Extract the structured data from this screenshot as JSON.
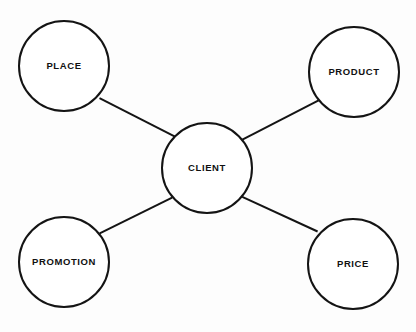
{
  "diagram": {
    "type": "hub-and-spoke",
    "title": "",
    "background_color": "#fdfdfd",
    "stroke_color": "#141414",
    "node_fill_color": "#ffffff",
    "text_color": "#111111",
    "center": {
      "id": "client",
      "label": "CLIENT",
      "cx": 207,
      "cy": 168,
      "r": 45
    },
    "nodes": [
      {
        "id": "place",
        "label": "PLACE",
        "cx": 64,
        "cy": 66,
        "r": 45,
        "position": "top-left"
      },
      {
        "id": "product",
        "label": "PRODUCT",
        "cx": 354,
        "cy": 72,
        "r": 45,
        "position": "top-right"
      },
      {
        "id": "promotion",
        "label": "PROMOTION",
        "cx": 64,
        "cy": 262,
        "r": 45,
        "position": "bottom-left"
      },
      {
        "id": "price",
        "label": "PRICE",
        "cx": 353,
        "cy": 264,
        "r": 45,
        "position": "bottom-right"
      }
    ],
    "edges": [
      {
        "id": "place-client",
        "from": "place",
        "to": "client",
        "x1": 99.5,
        "y1": 98.2,
        "x2": 175.5,
        "y2": 136.8
      },
      {
        "id": "client-product",
        "from": "client",
        "to": "product",
        "x1": 242.4,
        "y1": 139.7,
        "x2": 318.6,
        "y2": 100.3
      },
      {
        "id": "promotion-client",
        "from": "promotion",
        "to": "client",
        "x1": 99.7,
        "y1": 233.4,
        "x2": 172.1,
        "y2": 197.6
      },
      {
        "id": "client-price",
        "from": "client",
        "to": "price",
        "x1": 242.3,
        "y1": 196.8,
        "x2": 317.6,
        "y2": 231.5
      }
    ]
  }
}
